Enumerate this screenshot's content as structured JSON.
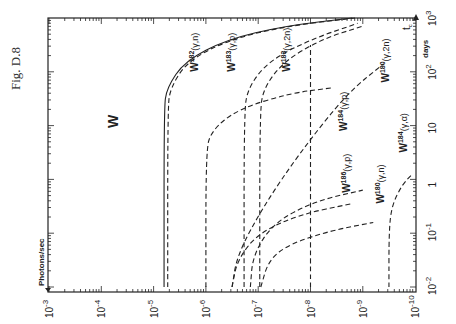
{
  "figure_label": "Fig. D.8",
  "chart_data": {
    "type": "line",
    "title": "W",
    "orientation": "rotated 90° (x-axis along bottom = Photons/sec, y-axis along right = days)",
    "xlabel": "Photons/sec",
    "ylabel": "days",
    "corner_label": "t_c",
    "x_scale": "log",
    "y_scale": "log",
    "xlim": [
      0.001,
      1e-10
    ],
    "ylim": [
      0.01,
      1000.0
    ],
    "x_ticks": [
      "10^-3",
      "10^-4",
      "10^-5",
      "10^-6",
      "10^-7",
      "10^-8",
      "10^-9",
      "10^-10"
    ],
    "y_ticks": [
      "10^-2",
      "10^-1",
      "1",
      "10",
      "10^2",
      "10^3"
    ],
    "grid": false,
    "series": [
      {
        "name": "W182(γ,n)",
        "style": "solid",
        "asymptote_x_exp": -5.2,
        "points_exp": [
          [
            -5.2,
            -2
          ],
          [
            -5.2,
            1.3
          ],
          [
            -5.25,
            1.7
          ],
          [
            -5.6,
            2.2
          ],
          [
            -6.4,
            2.6
          ],
          [
            -7.5,
            2.85
          ],
          [
            -8.8,
            3
          ]
        ]
      },
      {
        "name": "W182(γ,n) dashed",
        "style": "dashed",
        "asymptote_x_exp": -5.27,
        "points_exp": [
          [
            -5.27,
            -2
          ],
          [
            -5.27,
            1.3
          ],
          [
            -5.32,
            1.7
          ],
          [
            -5.65,
            2.2
          ],
          [
            -6.45,
            2.6
          ],
          [
            -7.55,
            2.85
          ],
          [
            -8.85,
            3
          ]
        ]
      },
      {
        "name": "W183(γ,p)",
        "style": "dashed",
        "asymptote_x_exp": -6.73,
        "points_exp": [
          [
            -6.73,
            -2
          ],
          [
            -6.73,
            1.2
          ],
          [
            -6.8,
            1.7
          ],
          [
            -7.2,
            2.2
          ],
          [
            -8.0,
            2.6
          ],
          [
            -8.9,
            2.9
          ]
        ]
      },
      {
        "name": "W183(γ,2n)",
        "style": "dashed",
        "asymptote_x_exp": -7.03,
        "points_exp": [
          [
            -7.03,
            -2
          ],
          [
            -7.03,
            1.2
          ],
          [
            -7.1,
            1.7
          ],
          [
            -7.5,
            2.2
          ],
          [
            -8.2,
            2.6
          ],
          [
            -9.0,
            2.85
          ]
        ]
      },
      {
        "name": "W(γ) 10^-6",
        "style": "dashed",
        "asymptote_x_exp": -6.0,
        "points_exp": [
          [
            -6.0,
            -2
          ],
          [
            -6.0,
            0.5
          ],
          [
            -6.1,
            0.9
          ],
          [
            -6.6,
            1.3
          ],
          [
            -7.6,
            1.6
          ],
          [
            -8.4,
            1.7
          ]
        ]
      },
      {
        "name": "W182(γ,2n)",
        "style": "dashed",
        "asymptote_x_exp": -8.0,
        "points_exp": [
          [
            -8.0,
            -2
          ],
          [
            -8.0,
            2.5
          ]
        ]
      },
      {
        "name": "W184(γ,p)",
        "style": "dashed",
        "points_exp": [
          [
            -6.85,
            -2
          ],
          [
            -6.9,
            -1.4
          ],
          [
            -7.3,
            -0.8
          ],
          [
            -8.1,
            -0.4
          ],
          [
            -9.0,
            -0.2
          ]
        ]
      },
      {
        "name": "W180(γ,2n)",
        "style": "dashed",
        "points_exp": [
          [
            -6.5,
            -2
          ],
          [
            -6.6,
            -1.4
          ],
          [
            -7.1,
            -0.5
          ],
          [
            -7.8,
            0.5
          ],
          [
            -8.7,
            1.6
          ],
          [
            -9.4,
            2.15
          ]
        ]
      },
      {
        "name": "W186(γ,p)",
        "style": "dashed",
        "points_exp": [
          [
            -6.5,
            -2
          ],
          [
            -6.6,
            -1.5
          ],
          [
            -7.0,
            -1.0
          ],
          [
            -7.8,
            -0.65
          ],
          [
            -8.8,
            -0.45
          ]
        ]
      },
      {
        "name": "W180(γ,n)",
        "style": "dashed",
        "points_exp": [
          [
            -7.05,
            -2
          ],
          [
            -7.2,
            -1.5
          ],
          [
            -7.6,
            -1.2
          ],
          [
            -8.4,
            -0.95
          ],
          [
            -9.2,
            -0.8
          ]
        ]
      },
      {
        "name": "W184(γ,α)",
        "style": "dashed",
        "asymptote_x_exp": -9.5,
        "points_exp": [
          [
            -9.5,
            -2
          ],
          [
            -9.5,
            -1.0
          ],
          [
            -9.55,
            -0.5
          ],
          [
            -9.75,
            -0.1
          ],
          [
            -9.95,
            0.1
          ]
        ]
      }
    ],
    "curve_labels": [
      {
        "text": "W182(γ,n)",
        "x_exp": -5.85,
        "y_exp": 2.0
      },
      {
        "text": "W183(γ,p)",
        "x_exp": -6.55,
        "y_exp": 2.0
      },
      {
        "text": "W183(γ,2n)",
        "x_exp": -7.6,
        "y_exp": 2.0
      },
      {
        "text": "W180(γ,2n)",
        "x_exp": -9.5,
        "y_exp": 1.8
      },
      {
        "text": "W184(γ,p)",
        "x_exp": -8.7,
        "y_exp": 0.9
      },
      {
        "text": "W186(γ,p)",
        "x_exp": -8.75,
        "y_exp": -0.25
      },
      {
        "text": "W180(γ,n)",
        "x_exp": -9.4,
        "y_exp": -0.45
      },
      {
        "text": "W184(γ,α)",
        "x_exp": -9.85,
        "y_exp": 0.5
      }
    ]
  }
}
